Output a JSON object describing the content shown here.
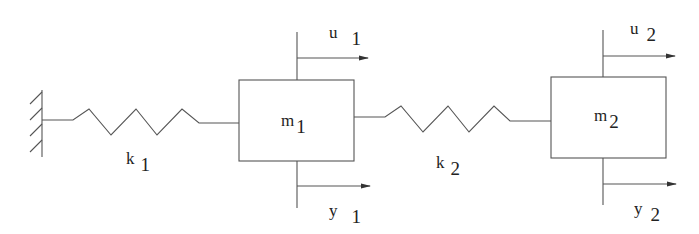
{
  "diagram": {
    "type": "two-mass spring system",
    "colors": {
      "line": "#555555",
      "text": "#222222",
      "background": "#ffffff"
    },
    "wall": {
      "label": ""
    },
    "springs": [
      {
        "name": "k",
        "subscript": "1"
      },
      {
        "name": "k",
        "subscript": "2"
      }
    ],
    "masses": [
      {
        "name": "m",
        "subscript": "1"
      },
      {
        "name": "m",
        "subscript": "2"
      }
    ],
    "inputs": [
      {
        "name": "u",
        "subscript": "1"
      },
      {
        "name": "u",
        "subscript": "2"
      }
    ],
    "outputs": [
      {
        "name": "y",
        "subscript": "1"
      },
      {
        "name": "y",
        "subscript": "2"
      }
    ]
  }
}
